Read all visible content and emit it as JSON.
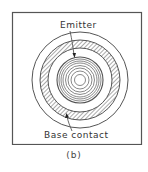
{
  "figure": {
    "caption": "(b)",
    "labels": {
      "emitter": "Emitter",
      "base_contact": "Base contact"
    },
    "colors": {
      "line": "#444444",
      "frame": "#555555",
      "background": "#ffffff"
    }
  }
}
